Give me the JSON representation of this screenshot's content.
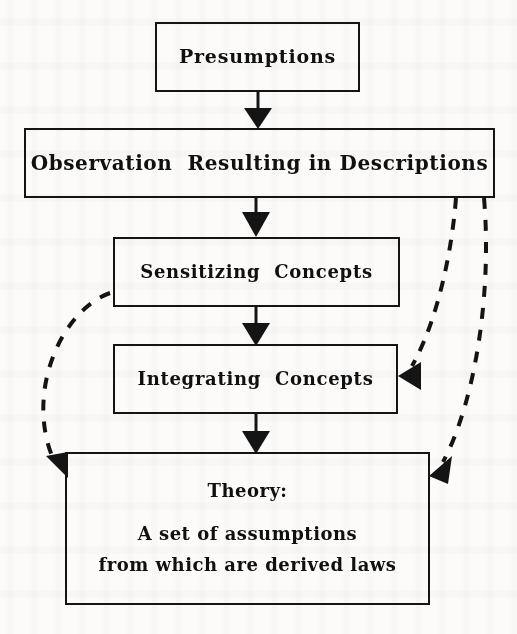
{
  "diagram": {
    "ink_color": "#141414",
    "paper_color": "#fcfbf9",
    "nodes": [
      {
        "id": "presumptions",
        "label": "Presumptions"
      },
      {
        "id": "observation",
        "label": "Observation  Resulting in Descriptions"
      },
      {
        "id": "sensitizing",
        "label": "Sensitizing  Concepts"
      },
      {
        "id": "integrating",
        "label": "Integrating  Concepts"
      },
      {
        "id": "theory",
        "line1": "Theory:",
        "line2": "A set of assumptions",
        "line3": "from which are derived laws"
      }
    ],
    "connectors": [
      {
        "id": "presumptions-to-observation",
        "style": "solid",
        "from": "presumptions",
        "to": "observation",
        "arrow": "down"
      },
      {
        "id": "observation-to-sensitizing",
        "style": "solid",
        "from": "observation",
        "to": "sensitizing",
        "arrow": "down"
      },
      {
        "id": "sensitizing-to-integrating",
        "style": "solid",
        "from": "sensitizing",
        "to": "integrating",
        "arrow": "down"
      },
      {
        "id": "integrating-to-theory",
        "style": "solid",
        "from": "integrating",
        "to": "theory",
        "arrow": "down"
      },
      {
        "id": "observation-to-integrating",
        "style": "dashed",
        "from": "observation",
        "to": "integrating",
        "arrow": "left"
      },
      {
        "id": "observation-to-theory",
        "style": "dashed",
        "from": "observation",
        "to": "theory",
        "arrow": "down-left"
      },
      {
        "id": "sensitizing-to-theory",
        "style": "dashed",
        "from": "sensitizing",
        "to": "theory",
        "arrow": "down-right"
      }
    ]
  }
}
